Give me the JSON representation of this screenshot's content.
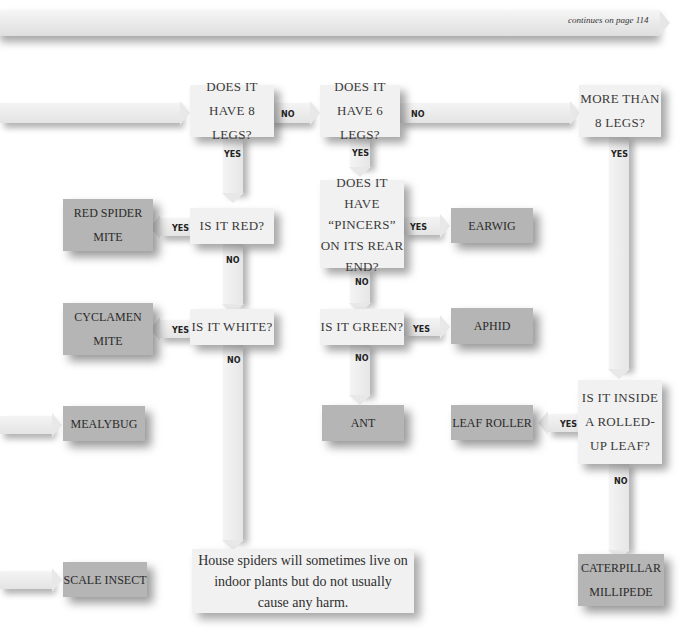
{
  "header": {
    "continues_label": "continues on page 114"
  },
  "questions": {
    "q8legs": "DOES IT HAVE 8 LEGS?",
    "q6legs": "DOES IT HAVE 6 LEGS?",
    "qmore8": "MORE THAN 8 LEGS?",
    "qred": "IS IT RED?",
    "qwhite": "IS IT WHITE?",
    "qpincers": "DOES IT HAVE “PINCERS” ON ITS REAR END?",
    "qgreen": "IS IT GREEN?",
    "qrolled": "IS IT INSIDE A ROLLED-UP LEAF?"
  },
  "answers": {
    "red_spider_mite": "RED SPIDER MITE",
    "cyclamen_mite": "CYCLAMEN MITE",
    "mealybug": "MEALYBUG",
    "scale_insect": "SCALE INSECT",
    "earwig": "EARWIG",
    "aphid": "APHID",
    "ant": "ANT",
    "leaf_roller": "LEAF ROLLER",
    "caterpillar_millipede": "CATERPILLAR MILLIPEDE"
  },
  "note": "House spiders will sometimes live on indoor plants but do not usually cause any harm.",
  "labels": {
    "yes": "YES",
    "no": "NO"
  },
  "colors": {
    "question_bg": "#f1f1f1",
    "answer_bg": "#b5b5b5",
    "arrow_bg": "#e8e8e8"
  }
}
